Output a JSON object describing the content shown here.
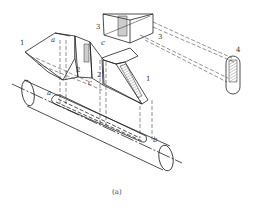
{
  "figure": {
    "caption": "(a)",
    "stroke_color": "#222222",
    "hatch_color": "#555555",
    "background": "#ffffff"
  },
  "labels": {
    "l1_left": "1",
    "l1_right": "1",
    "l2_left": "2",
    "l2_right": "2",
    "l3_left": "3",
    "l3_right": "3",
    "l4": "4",
    "c_top": "c",
    "c_bottom": "c",
    "a": "a",
    "b": "b",
    "a_top": "a"
  }
}
